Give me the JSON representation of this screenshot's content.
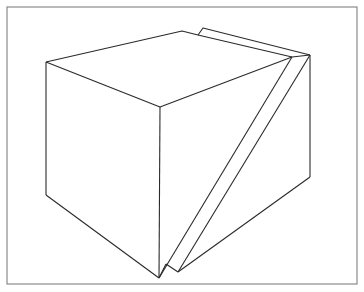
{
  "figure": {
    "description": "Line drawing of a cube with a thin slab leaning against its right side",
    "colors": {
      "background": "#ffffff",
      "frame": "#8a8a8a",
      "lines": "#2a2a2a"
    }
  }
}
